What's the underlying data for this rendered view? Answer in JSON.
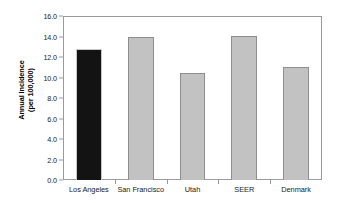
{
  "chart_data": {
    "type": "bar",
    "title": "",
    "subtitle": "",
    "xlabel": "",
    "ylabel": "Annual Incidence (per 100,000)",
    "ylabel_line1": "Annual Incidence",
    "ylabel_line2": "(per 100,000)",
    "categories": [
      "Los Angeles",
      "San Francisco",
      "Utah",
      "SEER",
      "Denmark"
    ],
    "values": [
      12.8,
      14.0,
      10.4,
      14.05,
      11.0
    ],
    "ylim": [
      0.0,
      16.0
    ],
    "ytick_labels": [
      "0.0",
      "2.0",
      "4.0",
      "6.0",
      "8.0",
      "10.0",
      "12.0",
      "14.0",
      "16.0"
    ],
    "ytick_values": [
      0.0,
      2.0,
      4.0,
      6.0,
      8.0,
      10.0,
      12.0,
      14.0,
      16.0
    ],
    "grid": false,
    "legend": null,
    "legend_position": "none",
    "bar_colors": [
      "#131313",
      "#c2c2c2",
      "#c2c2c2",
      "#c2c2c2",
      "#c2c2c2"
    ],
    "bar_border_colors": [
      "#c9c9c9",
      "#8e8e8e",
      "#8e8e8e",
      "#8e8e8e",
      "#8e8e8e"
    ],
    "highlight_category": "Los Angeles",
    "axis_color": "#9a9a9a",
    "background_color": "#ffffff",
    "text_color": "#1a1a1a"
  }
}
